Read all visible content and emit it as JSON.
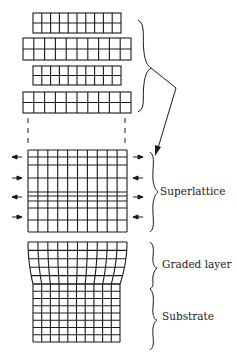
{
  "diagram": {
    "labels": {
      "superlattice": "Superlattice",
      "graded_layer": "Graded layer",
      "substrate": "Substrate"
    },
    "colors": {
      "line": "#1a1a1a",
      "background": "#ffffff"
    },
    "separate_layers": [
      {
        "x": 33,
        "y": 13,
        "w": 88,
        "h": 20,
        "cols": 10,
        "rows": 2
      },
      {
        "x": 23,
        "y": 38,
        "w": 108,
        "h": 22,
        "cols": 10,
        "rows": 2
      },
      {
        "x": 33,
        "y": 66,
        "w": 88,
        "h": 19,
        "cols": 10,
        "rows": 2
      },
      {
        "x": 23,
        "y": 92,
        "w": 108,
        "h": 21,
        "cols": 10,
        "rows": 2
      }
    ],
    "superlattice": {
      "x": 28,
      "y": 150,
      "w": 99,
      "h": 82,
      "cols": 10,
      "row_lines": [
        150,
        157,
        165,
        178,
        192,
        196,
        201,
        208,
        220,
        232
      ]
    },
    "arrows": [
      {
        "y": 157,
        "dir": "out"
      },
      {
        "y": 178,
        "dir": "in"
      },
      {
        "y": 197,
        "dir": "out"
      },
      {
        "y": 217,
        "dir": "in"
      }
    ]
  }
}
